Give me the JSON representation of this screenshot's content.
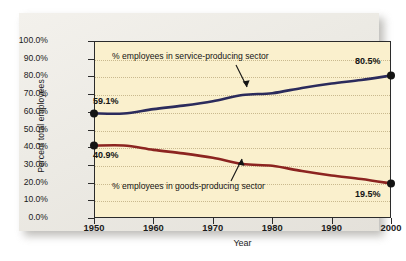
{
  "chart_data": {
    "type": "line",
    "title": "",
    "xlabel": "Year",
    "ylabel": "Percent total employees",
    "xlim": [
      1950,
      2000
    ],
    "ylim": [
      0,
      100
    ],
    "grid": true,
    "legend_position": "inline-annotations",
    "xticks": [
      "1950",
      "1960",
      "1970",
      "1980",
      "1990",
      "2000"
    ],
    "xtick_values": [
      1950,
      1960,
      1970,
      1980,
      1990,
      2000
    ],
    "yticks": [
      "0.0%",
      "10.0%",
      "20.0%",
      "30.0%",
      "40.0%",
      "50.0%",
      "60.0%",
      "70.0%",
      "80.0%",
      "90.0%",
      "100.0%"
    ],
    "ytick_values": [
      0,
      10,
      20,
      30,
      40,
      50,
      60,
      70,
      80,
      90,
      100
    ],
    "x": [
      1950,
      1955,
      1960,
      1965,
      1970,
      1975,
      1980,
      1985,
      1990,
      1995,
      2000
    ],
    "series": [
      {
        "name": "% employees in service-producing sector",
        "color": "#2b2b5c",
        "values": [
          59.1,
          59.0,
          61.5,
          63.5,
          66.0,
          69.5,
          70.5,
          73.5,
          76.0,
          78.0,
          80.5
        ],
        "endpoint_markers": [
          {
            "x": 1950,
            "y": 59.1,
            "label": "59.1%"
          },
          {
            "x": 2000,
            "y": 80.5,
            "label": "80.5%"
          }
        ]
      },
      {
        "name": "% employees in goods-producing sector",
        "color": "#8c2420",
        "values": [
          40.9,
          41.0,
          38.5,
          36.5,
          34.0,
          30.5,
          29.5,
          26.5,
          24.0,
          22.0,
          19.5
        ],
        "endpoint_markers": [
          {
            "x": 1950,
            "y": 40.9,
            "label": "40.9%"
          },
          {
            "x": 2000,
            "y": 19.5,
            "label": "19.5%"
          }
        ]
      }
    ],
    "annotations": [
      {
        "text": "% employees in service-producing sector",
        "points_to_series": "service"
      },
      {
        "text": "% employees in goods-producing sector",
        "points_to_series": "goods"
      }
    ]
  },
  "labels": {
    "ylabel": "Percent total employees",
    "xlabel": "Year",
    "service_annotation": "% employees in service-producing sector",
    "goods_annotation": "% employees in goods-producing sector",
    "service_start_value": "59.1%",
    "service_end_value": "80.5%",
    "goods_start_value": "40.9%",
    "goods_end_value": "19.5%"
  },
  "ytick_labels": [
    "100.0%",
    "90.0%",
    "80.0%",
    "70.0%",
    "60.0%",
    "50.0%",
    "40.0%",
    "30.0%",
    "20.0%",
    "10.0%",
    "0.0%"
  ],
  "xtick_labels": [
    "1950",
    "1960",
    "1970",
    "1980",
    "1990",
    "2000"
  ],
  "colors": {
    "service_line": "#2b2b5c",
    "goods_line": "#8c2420",
    "plot_background": "#faf0cd",
    "card_background": "#eceae4",
    "axis": "#2b2b2b",
    "gridline": "#c9b98e"
  }
}
